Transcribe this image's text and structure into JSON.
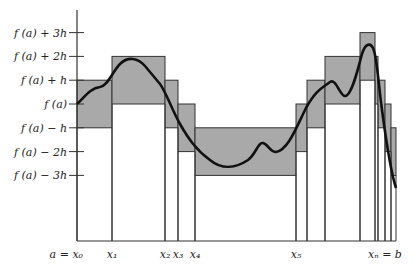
{
  "figure": {
    "y_ticks": [
      {
        "label": "f (a)  +  3h",
        "level": 3
      },
      {
        "label": "f (a)  +  2h",
        "level": 2
      },
      {
        "label": "f (a)  +  h",
        "level": 1
      },
      {
        "label": "f (a)",
        "level": 0
      },
      {
        "label": "f (a)  −  h",
        "level": -1
      },
      {
        "label": "f (a)  −  2h",
        "level": -2
      },
      {
        "label": "f (a)  −  3h",
        "level": -3
      }
    ],
    "x_labels": [
      {
        "label": "a  =  x₀",
        "at": 0
      },
      {
        "label": "x₁",
        "at": 1
      },
      {
        "label": "x₂",
        "at": 2
      },
      {
        "label": "x₃",
        "at": 3
      },
      {
        "label": "x₄",
        "at": 4
      },
      {
        "label": "x₅",
        "at": 5
      },
      {
        "label": "xₙ  =  b",
        "at": "n"
      }
    ],
    "intervals": [
      {
        "lower": -1,
        "upper": 1
      },
      {
        "lower": 0,
        "upper": 2
      },
      {
        "lower": -1,
        "upper": 1
      },
      {
        "lower": -2,
        "upper": 0
      },
      {
        "lower": -3,
        "upper": -1
      },
      {
        "lower": -2,
        "upper": 0
      },
      {
        "lower": -1,
        "upper": 1
      },
      {
        "lower": 0,
        "upper": 2
      },
      {
        "lower": 1,
        "upper": 3
      },
      {
        "lower": 0,
        "upper": 2
      },
      {
        "lower": -1,
        "upper": 1
      },
      {
        "lower": -2,
        "upper": 0
      },
      {
        "lower": -3,
        "upper": -1
      }
    ],
    "colors": {
      "band_fill": "#a9a9a9",
      "stroke": "#333333",
      "curve": "#111111"
    }
  }
}
